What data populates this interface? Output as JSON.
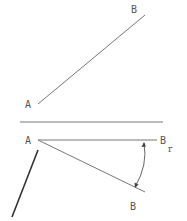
{
  "diagram": {
    "top_view": {
      "point_a_label": "A",
      "point_b_label": "B"
    },
    "bottom_view": {
      "point_a_label": "A",
      "rotated_b_label": "B",
      "rotated_b_subscript": "r",
      "point_b_label": "B"
    },
    "colors": {
      "line": "#777777",
      "thick_line": "#333333",
      "text": "#555555"
    }
  }
}
